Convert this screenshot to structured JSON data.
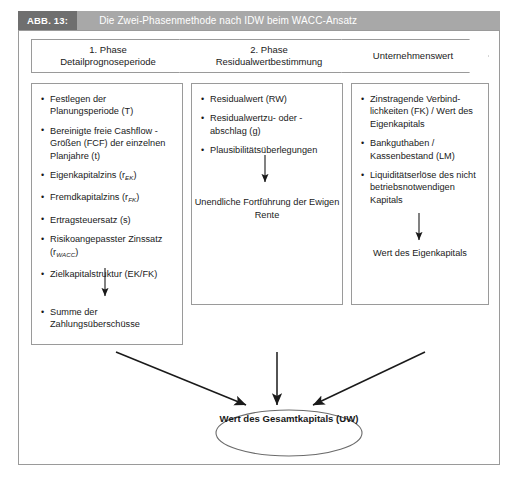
{
  "figure": {
    "label": "ABB. 13:",
    "title": "Die Zwei-Phasenmethode nach IDW beim WACC-Ansatz"
  },
  "colors": {
    "label_bg": "#6f6f6f",
    "title_bg": "#a8a8a8",
    "title_fg": "#ffffff",
    "border": "#9a9a9a",
    "text": "#1a1a1a",
    "background": "#ffffff"
  },
  "phases": [
    {
      "line1": "1. Phase",
      "line2": "Detailprognoseperiode"
    },
    {
      "line1": "2. Phase",
      "line2": "Residualwertbestimmung"
    },
    {
      "line1": "Unternehmenswert",
      "line2": ""
    }
  ],
  "columns": [
    {
      "name": "detailprognoseperiode",
      "bullets": [
        {
          "text": "Festlegen der Planungsperiode (T)"
        },
        {
          "text": "Bereinigte freie Cashflow - Größen (FCF) der einzelnen Planjahre (t)"
        },
        {
          "text": "Eigenkapitalzins (r",
          "sub": "EK",
          "tail": ")"
        },
        {
          "text": "Fremdkapitalzins (r",
          "sub": "FK",
          "tail": ")"
        },
        {
          "text": "Ertragsteuersatz (s)"
        },
        {
          "text": "Risikoangepasster Zinssatz (r",
          "sub": "WACC",
          "tail": ")"
        },
        {
          "text": "Zielkapitalstruktur (EK/FK)"
        }
      ],
      "result_bullet": "Summe der Zahlungsüberschüsse"
    },
    {
      "name": "residualwertbestimmung",
      "bullets": [
        {
          "text": "Residualwert (RW)"
        },
        {
          "text": "Residualwertzu- oder -abschlag (g)"
        },
        {
          "text": "Plausibilitätsüberlegungen"
        }
      ],
      "caption": "Unendliche Fortführung der Ewigen Rente"
    },
    {
      "name": "unternehmenswert",
      "bullets": [
        {
          "text": "Zinstragende Verbind-lichkeiten (FK) / Wert des Eigenkapitals"
        },
        {
          "text": "Bankguthaben / Kassenbestand (LM)"
        },
        {
          "text": "Liquiditätserlöse des nicht betriebsnotwendigen Kapitals"
        }
      ],
      "caption": "Wert des Eigenkapitals"
    }
  ],
  "result": {
    "label": "Wert des Gesamtkapitals (UW)"
  }
}
